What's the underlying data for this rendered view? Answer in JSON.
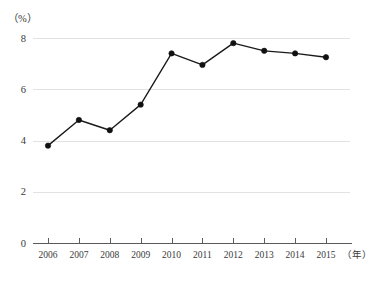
{
  "chart_data": {
    "type": "line",
    "title": "",
    "subtitle": "",
    "xlabel": "年",
    "ylabel": "（%）",
    "categories": [
      "2006",
      "2007",
      "2008",
      "2009",
      "2010",
      "2011",
      "2012",
      "2013",
      "2014",
      "2015"
    ],
    "values": [
      3.8,
      4.8,
      4.4,
      5.4,
      7.4,
      6.95,
      7.8,
      7.5,
      7.4,
      7.25
    ],
    "series": [
      {
        "name": "",
        "values": [
          3.8,
          4.8,
          4.4,
          5.4,
          7.4,
          6.95,
          7.8,
          7.5,
          7.4,
          7.25
        ]
      }
    ],
    "ylim": [
      0,
      8
    ],
    "xlim": [
      "2006",
      "2015"
    ],
    "y_ticks": [
      "0",
      "2",
      "4",
      "6",
      "8"
    ],
    "y_tick_values": [
      0,
      2,
      4,
      6,
      8
    ],
    "x_ticks": [
      "2006",
      "2007",
      "2008",
      "2009",
      "2010",
      "2011",
      "2012",
      "2013",
      "2014",
      "2015"
    ],
    "grid": true,
    "grid_axis": "y",
    "legend": false,
    "legend_position": "none",
    "markers": true,
    "marker_shape": "circle",
    "annotations": []
  },
  "axes": {
    "y_unit_label": "（%）",
    "x_unit_label": "（年）"
  },
  "colors": {
    "line": "#1a1a1a",
    "marker": "#111111",
    "gridline": "#e2e2e2",
    "axis": "#5b5b5b",
    "text": "#3a3a3a",
    "background": "#ffffff"
  }
}
